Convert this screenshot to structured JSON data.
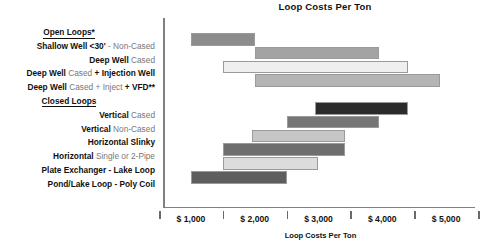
{
  "chart_data": {
    "type": "bar",
    "orientation": "horizontal-range",
    "title": "Loop Costs Per Ton",
    "xlabel": "Loop Costs Per Ton",
    "ylabel": "",
    "xlim": [
      500,
      5500
    ],
    "xtick_values": [
      500,
      1500,
      2500,
      3500,
      4500,
      5500
    ],
    "xtick_labels": [
      "$ 1,000",
      "$ 2,000",
      "$ 3,000",
      "$ 4,000",
      "$ 5,000"
    ],
    "xtick_label_values": [
      1000,
      2000,
      3000,
      4000,
      5000
    ],
    "grid": false,
    "legend": null,
    "groups": [
      {
        "name": "Open Loops*",
        "underline": true,
        "categories": [
          {
            "label_bold": "Shallow Well",
            "label_rest": " <30' - Non-Cased",
            "low": 1000,
            "high": 2000,
            "color": "#8c8c8c"
          },
          {
            "label_bold": "Deep Well",
            "label_rest": " Cased",
            "low": 2000,
            "high": 3950,
            "color": "#a3a3a3"
          },
          {
            "label_bold": "Deep Well",
            "label_rest": " Cased + Injection Well",
            "label_bold2": "+ Injection Well",
            "low": 1500,
            "high": 4400,
            "color": "#efefef"
          },
          {
            "label_bold": "Deep Well",
            "label_rest": " Cased + Inject + VFD**",
            "low": 2000,
            "high": 4900,
            "color": "#b4b4b4"
          }
        ]
      },
      {
        "name": "Closed Loops",
        "underline": true,
        "categories": [
          {
            "label_bold": "Vertical",
            "label_rest": " Cased",
            "low": 2950,
            "high": 4400,
            "color": "#2b2b2b"
          },
          {
            "label_bold": "Vertical",
            "label_rest": " Non-Cased",
            "low": 2500,
            "high": 3950,
            "color": "#767676"
          },
          {
            "label_bold": "Horizontal Slinky",
            "label_rest": "",
            "low": 1950,
            "high": 3420,
            "color": "#c6c6c6"
          },
          {
            "label_bold": "Horizontal",
            "label_rest": " Single or 2-Pipe",
            "low": 1500,
            "high": 3420,
            "color": "#6e6e6e"
          },
          {
            "label_bold": "Plate Exchanger - Lake Loop",
            "label_rest": "",
            "low": 1500,
            "high": 3000,
            "color": "#dcdcdc"
          },
          {
            "label_bold": "Pond/Lake Loop - Poly Coil",
            "label_rest": "",
            "low": 1000,
            "high": 2500,
            "color": "#5e5e5e"
          }
        ]
      }
    ]
  },
  "labels": {
    "group_open": "Open Loops*",
    "group_closed": "Closed Loops",
    "row1_bold": "Shallow Well",
    "row1_rest": "<30'",
    "row1_rest2": "- Non-Cased",
    "row2_bold": "Deep Well",
    "row2_rest": "Cased",
    "row3_bold": "Deep Well",
    "row3_rest": "Cased",
    "row3_bold2": "+ Injection Well",
    "row4_bold": "Deep Well",
    "row4_rest": "Cased + Inject",
    "row4_bold2": "+ VFD**",
    "row5_bold": "Vertical",
    "row5_rest": "Cased",
    "row6_bold": "Vertical",
    "row6_rest": "Non-Cased",
    "row7_bold": "Horizontal Slinky",
    "row8_bold": "Horizontal",
    "row8_rest": "Single or 2-Pipe",
    "row9_bold": "Plate Exchanger - Lake Loop",
    "row10_bold": "Pond/Lake Loop - Poly Coil"
  },
  "axis": {
    "title": "Loop Costs Per Ton",
    "tick_labels": [
      "$ 1,000",
      "$ 2,000",
      "$ 3,000",
      "$ 4,000",
      "$ 5,000"
    ]
  }
}
